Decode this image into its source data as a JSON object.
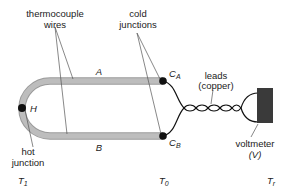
{
  "diagram": {
    "colors": {
      "wire_fill": "#b8b8b8",
      "wire_edge": "#9a9a9a",
      "junction": "#111111",
      "lead": "#111111",
      "voltmeter": "#3a3a3a",
      "text": "#222222"
    },
    "labels": {
      "thermocouple_wires_1": "thermocouple",
      "thermocouple_wires_2": "wires",
      "cold_junctions_1": "cold",
      "cold_junctions_2": "junctions",
      "wire_a": "A",
      "wire_b": "B",
      "hot_junction_marker": "H",
      "hot_junction_1": "hot",
      "hot_junction_2": "junction",
      "cold_a_main": "C",
      "cold_a_sub": "A",
      "cold_b_main": "C",
      "cold_b_sub": "B",
      "leads_1": "leads",
      "leads_2": "(copper)",
      "voltmeter_1": "voltmeter",
      "voltmeter_2": "(V)",
      "temp_hot_main": "T",
      "temp_hot_sub": "1",
      "temp_cold_main": "T",
      "temp_cold_sub": "0",
      "temp_ref_main": "T",
      "temp_ref_sub": "r"
    }
  }
}
